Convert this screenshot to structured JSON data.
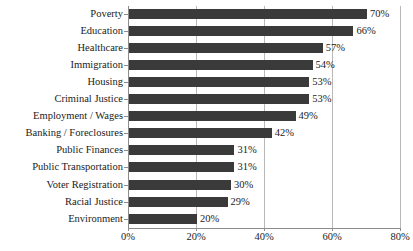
{
  "chart_data": {
    "type": "bar",
    "orientation": "horizontal",
    "title": "",
    "xlabel": "",
    "ylabel": "",
    "xlim": [
      0,
      80
    ],
    "grid": true,
    "legend": false,
    "bar_color": "#3a3a3a",
    "gridline_color": "#b8b8b8",
    "axis_color": "#8c8c8c",
    "xticks": [
      "0%",
      "20%",
      "40%",
      "60%",
      "80%"
    ],
    "xtick_values": [
      0,
      20,
      40,
      60,
      80
    ],
    "categories": [
      "Poverty",
      "Education",
      "Healthcare",
      "Immigration",
      "Housing",
      "Criminal Justice",
      "Employment / Wages",
      "Banking / Foreclosures",
      "Public Finances",
      "Public Transportation",
      "Voter Registration",
      "Racial Justice",
      "Environment"
    ],
    "values": [
      70,
      66,
      57,
      54,
      53,
      53,
      49,
      42,
      31,
      31,
      30,
      29,
      20
    ],
    "data_labels": [
      "70%",
      "66%",
      "57%",
      "54%",
      "53%",
      "53%",
      "49%",
      "42%",
      "31%",
      "31%",
      "30%",
      "29%",
      "20%"
    ]
  },
  "title_remnant": "· ·  ···       · ··   ·  · ··· ·  · ··"
}
